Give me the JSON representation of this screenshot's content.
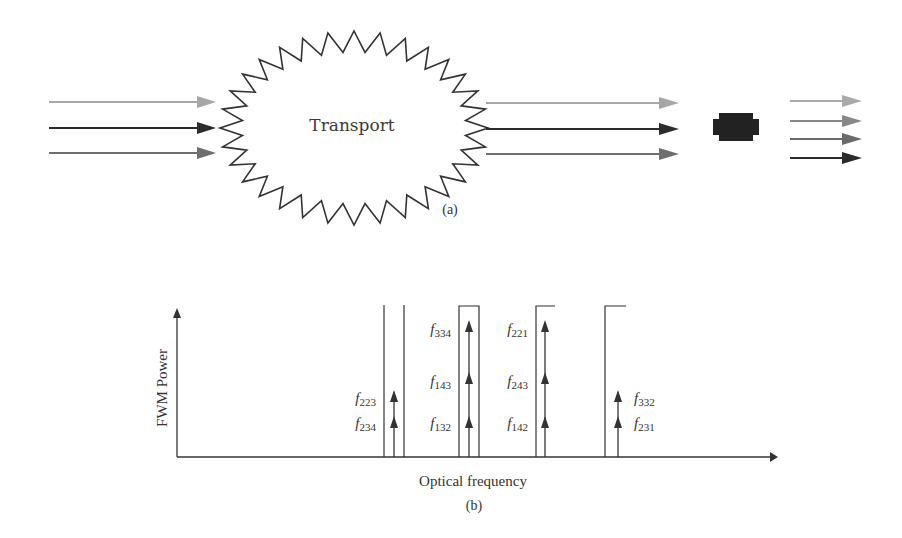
{
  "panel_a": {
    "transport_label": "Transport",
    "caption": "(a)",
    "input_arrows": [
      {
        "name": "input-channel-1",
        "color": "#a6a6a6"
      },
      {
        "name": "input-channel-2",
        "color": "#2b2b2b"
      },
      {
        "name": "input-channel-3",
        "color": "#6e6e6e"
      }
    ],
    "output_arrows": [
      {
        "name": "output-channel-1",
        "color": "#a6a6a6"
      },
      {
        "name": "output-channel-2",
        "color": "#2b2b2b"
      },
      {
        "name": "output-channel-3",
        "color": "#6e6e6e"
      }
    ],
    "receiver_arrows": [
      {
        "name": "received-channel-1",
        "color": "#aaaaaa"
      },
      {
        "name": "received-channel-2",
        "color": "#888888"
      },
      {
        "name": "received-channel-3",
        "color": "#6a6a6a"
      },
      {
        "name": "received-channel-4",
        "color": "#2b2b2b"
      }
    ]
  },
  "panel_b": {
    "ylabel": "FWM Power",
    "xlabel": "Optical frequency",
    "caption": "(b)",
    "groups": [
      {
        "labels": [
          {
            "base": "f",
            "sub": "223"
          },
          {
            "base": "f",
            "sub": "234"
          }
        ],
        "label_side": "left",
        "arrows": 2
      },
      {
        "labels": [
          {
            "base": "f",
            "sub": "334"
          },
          {
            "base": "f",
            "sub": "143"
          },
          {
            "base": "f",
            "sub": "132"
          }
        ],
        "label_side": "left",
        "arrows": 3
      },
      {
        "labels": [
          {
            "base": "f",
            "sub": "221"
          },
          {
            "base": "f",
            "sub": "243"
          },
          {
            "base": "f",
            "sub": "142"
          }
        ],
        "label_side": "left",
        "arrows": 3
      },
      {
        "labels": [
          {
            "base": "f",
            "sub": "332"
          },
          {
            "base": "f",
            "sub": "231"
          }
        ],
        "label_side": "right",
        "arrows": 2
      }
    ]
  }
}
